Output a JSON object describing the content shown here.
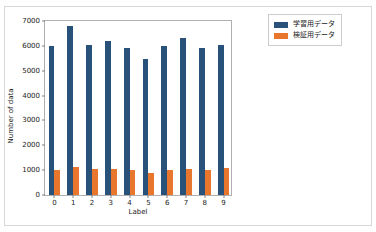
{
  "chart_data": {
    "type": "bar",
    "title": "",
    "xlabel": "Label",
    "ylabel": "Number of data",
    "categories": [
      "0",
      "1",
      "2",
      "3",
      "4",
      "5",
      "6",
      "7",
      "8",
      "9"
    ],
    "series": [
      {
        "name": "学習用データ",
        "color": "#28527a",
        "values": [
          5920,
          6740,
          5960,
          6130,
          5840,
          5420,
          5920,
          6260,
          5850,
          5950
        ]
      },
      {
        "name": "検証用データ",
        "color": "#e8762c",
        "values": [
          980,
          1130,
          1040,
          1020,
          980,
          880,
          980,
          1030,
          980,
          1060
        ]
      }
    ],
    "ylim": [
      0,
      7000
    ],
    "yticks": [
      "0",
      "1000",
      "2000",
      "3000",
      "4000",
      "5000",
      "6000",
      "7000"
    ],
    "ytick_values": [
      0,
      1000,
      2000,
      3000,
      4000,
      5000,
      6000,
      7000
    ],
    "grid": false,
    "legend_position": "outside-right-top"
  }
}
